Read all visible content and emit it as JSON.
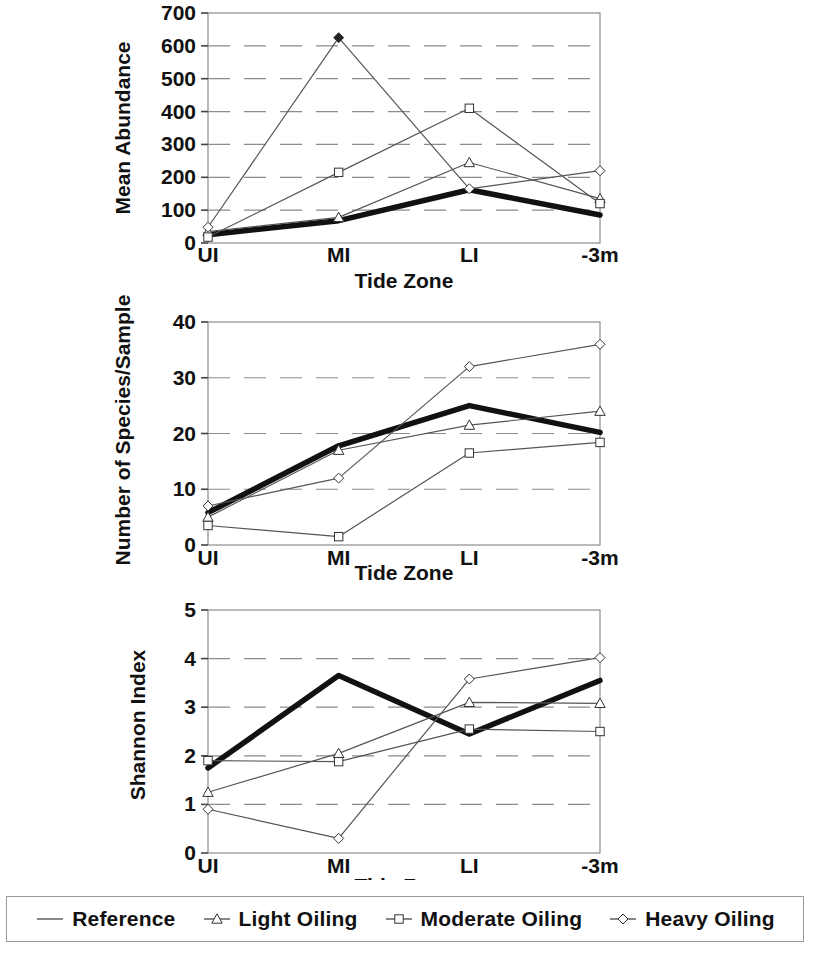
{
  "figure": {
    "xlabel": "Tide Zone",
    "categories": [
      "UI",
      "MI",
      "LI",
      "-3m"
    ]
  },
  "legend": {
    "position": "bottom",
    "items": [
      {
        "label": "Reference",
        "marker": "line",
        "icon": "reference-line-icon"
      },
      {
        "label": "Light Oiling",
        "marker": "triangle",
        "icon": "triangle-marker-icon"
      },
      {
        "label": "Moderate Oiling",
        "marker": "square",
        "icon": "square-marker-icon"
      },
      {
        "label": "Heavy Oiling",
        "marker": "diamond",
        "icon": "diamond-marker-icon"
      }
    ]
  },
  "colors": {
    "reference": "#111111",
    "series_line": "#555555",
    "grid": "#8c8c8c",
    "axis": "#555555",
    "background": "#ffffff"
  },
  "chart_data": [
    {
      "type": "line",
      "id": "mean-abundance",
      "title": "",
      "xlabel": "Tide Zone",
      "ylabel": "Mean Abundance",
      "categories": [
        "UI",
        "MI",
        "LI",
        "-3m"
      ],
      "ylim": [
        0,
        700
      ],
      "yticks": [
        0,
        100,
        200,
        300,
        400,
        500,
        600,
        700
      ],
      "grid": true,
      "series": [
        {
          "name": "Reference",
          "marker": "line",
          "values": [
            25,
            68,
            162,
            85
          ]
        },
        {
          "name": "Light Oiling",
          "marker": "triangle",
          "values": [
            35,
            78,
            245,
            135
          ]
        },
        {
          "name": "Moderate Oiling",
          "marker": "square",
          "values": [
            18,
            215,
            410,
            120
          ]
        },
        {
          "name": "Heavy Oiling",
          "marker": "diamond",
          "values": [
            48,
            625,
            165,
            220
          ]
        }
      ]
    },
    {
      "type": "line",
      "id": "number-of-species",
      "title": "",
      "xlabel": "Tide Zone",
      "ylabel": "Number of Species/Sample",
      "categories": [
        "UI",
        "MI",
        "LI",
        "-3m"
      ],
      "ylim": [
        0,
        40
      ],
      "yticks": [
        0,
        10,
        20,
        30,
        40
      ],
      "grid": true,
      "series": [
        {
          "name": "Reference",
          "marker": "line",
          "values": [
            5.8,
            17.8,
            25.0,
            20.2
          ]
        },
        {
          "name": "Light Oiling",
          "marker": "triangle",
          "values": [
            5.0,
            17.0,
            21.5,
            24.0
          ]
        },
        {
          "name": "Moderate Oiling",
          "marker": "square",
          "values": [
            3.5,
            1.5,
            16.5,
            18.4
          ]
        },
        {
          "name": "Heavy Oiling",
          "marker": "diamond",
          "values": [
            7.0,
            12.0,
            32.0,
            36.0
          ]
        }
      ]
    },
    {
      "type": "line",
      "id": "shannon-index",
      "title": "",
      "xlabel": "Tide Zone",
      "ylabel": "Shannon Index",
      "categories": [
        "UI",
        "MI",
        "LI",
        "-3m"
      ],
      "ylim": [
        0,
        5
      ],
      "yticks": [
        0,
        1,
        2,
        3,
        4,
        5
      ],
      "grid": true,
      "series": [
        {
          "name": "Reference",
          "marker": "line",
          "values": [
            1.75,
            3.65,
            2.45,
            3.55
          ]
        },
        {
          "name": "Light Oiling",
          "marker": "triangle",
          "values": [
            1.25,
            2.05,
            3.1,
            3.08
          ]
        },
        {
          "name": "Moderate Oiling",
          "marker": "square",
          "values": [
            1.9,
            1.88,
            2.55,
            2.5
          ]
        },
        {
          "name": "Heavy Oiling",
          "marker": "diamond",
          "values": [
            0.9,
            0.3,
            3.58,
            4.02
          ]
        }
      ]
    }
  ]
}
